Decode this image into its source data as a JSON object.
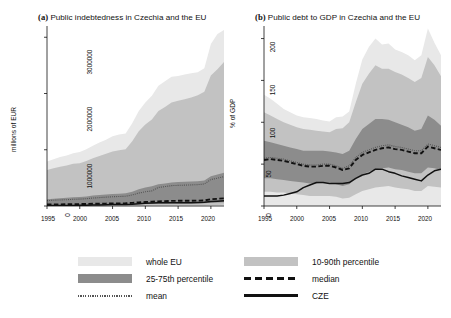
{
  "figure": {
    "panels": [
      {
        "tag": "(a)",
        "title": "Public indebtedness in Czechia and the EU",
        "ylabel": "millions of EUR",
        "xlabel": "year",
        "yticks": [
          "0",
          "1000000",
          "2000000",
          "3000000"
        ],
        "xticks": [
          "1995",
          "2000",
          "2005",
          "2010",
          "2015",
          "2020"
        ]
      },
      {
        "tag": "(b)",
        "title": "Public debt to GDP in Czechia and the EU",
        "ylabel": "% of GDP",
        "xlabel": "year",
        "yticks": [
          "0",
          "50",
          "100",
          "150",
          "200"
        ],
        "xticks": [
          "1995",
          "2000",
          "2005",
          "2010",
          "2015",
          "2020"
        ]
      }
    ]
  },
  "legend": {
    "items": [
      {
        "key": "whole-eu",
        "label": "whole EU",
        "swatch": "band",
        "color": "#e8e8e8"
      },
      {
        "key": "10-90",
        "label": "10-90th percentile",
        "swatch": "band",
        "color": "#c2c2c2"
      },
      {
        "key": "25-75",
        "label": "25-75th percentile",
        "swatch": "band",
        "color": "#8c8c8c"
      },
      {
        "key": "median",
        "label": "median",
        "swatch": "dashed-line",
        "color": "#111111"
      },
      {
        "key": "mean",
        "label": "mean",
        "swatch": "dotted-line",
        "color": "#555555"
      },
      {
        "key": "cze",
        "label": "CZE",
        "swatch": "solid-line",
        "color": "#111111"
      }
    ]
  },
  "colors": {
    "whole_eu": "#e8e8e8",
    "p10_90": "#c2c2c2",
    "p25_75": "#8c8c8c",
    "median": "#111111",
    "mean": "#555555",
    "cze": "#111111",
    "axis": "#111111",
    "background": "#ffffff"
  },
  "chart_data": [
    {
      "type": "area",
      "panel": "a",
      "title": "Public indebtedness in Czechia and the EU",
      "xlabel": "year",
      "ylabel": "millions of EUR",
      "xlim": [
        1995,
        2022
      ],
      "ylim": [
        0,
        3200000
      ],
      "yticks": [
        0,
        1000000,
        2000000,
        3000000
      ],
      "xticks": [
        1995,
        2000,
        2005,
        2010,
        2015,
        2020
      ],
      "grid": false,
      "legend_position": "below-figure",
      "x": [
        1995,
        1996,
        1997,
        1998,
        1999,
        2000,
        2001,
        2002,
        2003,
        2004,
        2005,
        2006,
        2007,
        2008,
        2009,
        2010,
        2011,
        2012,
        2013,
        2014,
        2015,
        2016,
        2017,
        2018,
        2019,
        2020,
        2021,
        2022
      ],
      "series": [
        {
          "name": "whole EU max",
          "values": [
            790000,
            830000,
            870000,
            900000,
            940000,
            960000,
            1010000,
            1070000,
            1130000,
            1180000,
            1240000,
            1270000,
            1290000,
            1470000,
            1690000,
            1840000,
            1960000,
            2140000,
            2220000,
            2300000,
            2310000,
            2340000,
            2360000,
            2380000,
            2450000,
            2880000,
            3060000,
            3130000
          ]
        },
        {
          "name": "90th percentile",
          "values": [
            640000,
            670000,
            700000,
            720000,
            750000,
            760000,
            800000,
            850000,
            890000,
            930000,
            970000,
            990000,
            1010000,
            1150000,
            1330000,
            1450000,
            1540000,
            1690000,
            1760000,
            1840000,
            1870000,
            1900000,
            1930000,
            1970000,
            2030000,
            2320000,
            2430000,
            2560000
          ]
        },
        {
          "name": "75th percentile",
          "values": [
            120000,
            130000,
            140000,
            145000,
            155000,
            160000,
            170000,
            185000,
            195000,
            205000,
            215000,
            220000,
            225000,
            255000,
            300000,
            330000,
            350000,
            385000,
            400000,
            420000,
            425000,
            430000,
            435000,
            440000,
            455000,
            530000,
            560000,
            590000
          ]
        },
        {
          "name": "mean",
          "values": [
            96000,
            102000,
            108000,
            112000,
            119000,
            122000,
            130000,
            141000,
            149000,
            157000,
            165000,
            169000,
            173000,
            196000,
            230000,
            253000,
            269000,
            330000,
            345000,
            362000,
            367000,
            371000,
            375000,
            380000,
            392000,
            470000,
            495000,
            522000
          ]
        },
        {
          "name": "median",
          "values": [
            26000,
            28000,
            29000,
            31000,
            33000,
            34000,
            36000,
            39000,
            41000,
            43000,
            46000,
            47000,
            48000,
            55000,
            64000,
            71000,
            76000,
            83000,
            87000,
            91000,
            92000,
            93000,
            94000,
            95000,
            99000,
            120000,
            128000,
            136000
          ]
        },
        {
          "name": "25th percentile",
          "values": [
            12000,
            13000,
            14000,
            15000,
            16000,
            16500,
            17500,
            19000,
            20000,
            21000,
            22000,
            23000,
            23500,
            27000,
            31000,
            34000,
            37000,
            40000,
            42000,
            44000,
            45000,
            45500,
            46000,
            46500,
            48000,
            58000,
            62000,
            66000
          ]
        },
        {
          "name": "10th percentile",
          "values": [
            4000,
            4300,
            4600,
            4800,
            5100,
            5300,
            5600,
            6000,
            6400,
            6700,
            7100,
            7300,
            7500,
            8600,
            10000,
            11000,
            11700,
            12800,
            13400,
            14000,
            14200,
            14400,
            14600,
            14800,
            15300,
            18500,
            19700,
            21000
          ]
        },
        {
          "name": "CZE",
          "values": [
            6500,
            7200,
            8000,
            8800,
            10000,
            11500,
            13500,
            16000,
            19000,
            22000,
            25000,
            26500,
            27500,
            32000,
            40000,
            47000,
            52000,
            57000,
            59000,
            60000,
            58000,
            59000,
            60000,
            62000,
            65000,
            78000,
            86000,
            94000
          ]
        }
      ]
    },
    {
      "type": "area",
      "panel": "b",
      "title": "Public debt to GDP in Czechia and the EU",
      "xlabel": "year",
      "ylabel": "% of GDP",
      "xlim": [
        1995,
        2022
      ],
      "ylim": [
        0,
        215
      ],
      "yticks": [
        0,
        50,
        100,
        150,
        200
      ],
      "xticks": [
        1995,
        2000,
        2005,
        2010,
        2015,
        2020
      ],
      "grid": false,
      "legend_position": "below-figure",
      "x": [
        1995,
        1996,
        1997,
        1998,
        1999,
        2000,
        2001,
        2002,
        2003,
        2004,
        2005,
        2006,
        2007,
        2008,
        2009,
        2010,
        2011,
        2012,
        2013,
        2014,
        2015,
        2016,
        2017,
        2018,
        2019,
        2020,
        2021,
        2022
      ],
      "series": [
        {
          "name": "whole EU max",
          "values": [
            133,
            128,
            122,
            116,
            112,
            108,
            106,
            105,
            104,
            102,
            101,
            106,
            107,
            113,
            146,
            175,
            190,
            200,
            193,
            194,
            187,
            184,
            180,
            174,
            180,
            212,
            195,
            180
          ]
        },
        {
          "name": "90th percentile",
          "values": [
            112,
            108,
            104,
            100,
            97,
            94,
            92,
            91,
            90,
            89,
            88,
            92,
            93,
            100,
            124,
            146,
            158,
            168,
            164,
            164,
            160,
            157,
            153,
            148,
            153,
            178,
            168,
            155
          ]
        },
        {
          "name": "75th percentile",
          "values": [
            78,
            76,
            74,
            72,
            70,
            68,
            66,
            66,
            66,
            66,
            65,
            64,
            62,
            66,
            80,
            92,
            98,
            104,
            104,
            103,
            100,
            97,
            94,
            90,
            92,
            108,
            103,
            96
          ]
        },
        {
          "name": "mean",
          "values": [
            57,
            58,
            57,
            56,
            54,
            52,
            50,
            49,
            49,
            50,
            50,
            48,
            45,
            48,
            58,
            64,
            67,
            70,
            72,
            73,
            71,
            70,
            68,
            66,
            66,
            74,
            72,
            70
          ]
        },
        {
          "name": "median",
          "values": [
            55,
            56,
            55,
            54,
            52,
            50,
            48,
            47,
            47,
            48,
            48,
            46,
            43,
            45,
            55,
            61,
            64,
            67,
            69,
            70,
            68,
            67,
            65,
            63,
            63,
            71,
            69,
            67
          ]
        },
        {
          "name": "25th percentile",
          "values": [
            33,
            33,
            32,
            31,
            30,
            29,
            28,
            27,
            27,
            28,
            28,
            26,
            24,
            26,
            33,
            38,
            41,
            44,
            45,
            46,
            44,
            43,
            41,
            39,
            39,
            46,
            45,
            43
          ]
        },
        {
          "name": "10th percentile",
          "values": [
            17,
            17,
            16,
            16,
            15,
            14,
            13,
            12,
            12,
            12,
            12,
            11,
            9,
            10,
            14,
            18,
            20,
            22,
            23,
            24,
            22,
            21,
            20,
            18,
            18,
            24,
            23,
            22
          ]
        },
        {
          "name": "CZE",
          "values": [
            12,
            12,
            12,
            13,
            15,
            17,
            22,
            25,
            28,
            28,
            27,
            27,
            27,
            28,
            33,
            37,
            39,
            44,
            44,
            41,
            39,
            36,
            34,
            32,
            30,
            37,
            42,
            44
          ]
        }
      ]
    }
  ]
}
